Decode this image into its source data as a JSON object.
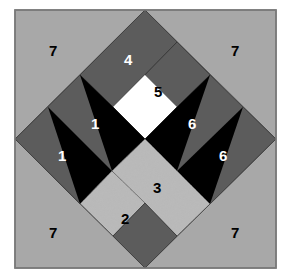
{
  "colors": {
    "background": "#a8a8a8",
    "dark_gray": "#5c5c5c",
    "black": "#000000",
    "white": "#ffffff",
    "speckle": "#b8b8b8",
    "border": "#7a7a7a"
  },
  "labels": {
    "corner_tl": "7",
    "corner_tr": "7",
    "corner_bl": "7",
    "corner_br": "7",
    "top_band": "4",
    "white_square": "5",
    "left_inner": "1",
    "left_outer": "1",
    "right_inner": "6",
    "right_outer": "6",
    "center_speckle": "3",
    "lower_speckle": "2"
  }
}
